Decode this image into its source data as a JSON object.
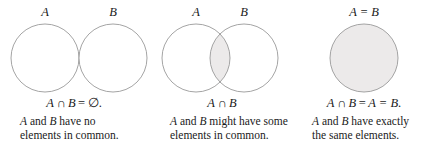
{
  "figure": {
    "colors": {
      "stroke": "#9a9a9a",
      "shade": "#eceaea",
      "text": "#1a1a1a",
      "background": "#ffffff"
    }
  },
  "panels": [
    {
      "id": "disjoint",
      "venn_labels": [
        {
          "text": "A",
          "x": 45
        },
        {
          "text": "B",
          "x": 113
        }
      ],
      "formula": {
        "set_a": "A",
        "intersect": "∩",
        "set_b": "B",
        "equals": "=",
        "result": "∅",
        "period": "."
      },
      "caption": {
        "line1_pre": "A",
        "line1_mid": " and ",
        "line1_var2": "B",
        "line1_post": " have no",
        "line2": "elements in common."
      },
      "shading": "none"
    },
    {
      "id": "overlap",
      "venn_labels": [
        {
          "text": "A",
          "x": 48
        },
        {
          "text": "B",
          "x": 96
        }
      ],
      "formula": {
        "set_a": "A",
        "intersect": "∩",
        "set_b": "B",
        "equals": "",
        "result": "",
        "period": ""
      },
      "caption": {
        "line1_pre": "A",
        "line1_mid": " and ",
        "line1_var2": "B",
        "line1_post": " might have some",
        "line2": "elements in common."
      },
      "shading": "lens"
    },
    {
      "id": "equal",
      "venn_labels": [
        {
          "text": "A = B",
          "x": 68
        }
      ],
      "formula": {
        "set_a": "A",
        "intersect": "∩",
        "set_b": "B",
        "equals": "=",
        "result": "A = B",
        "period": "."
      },
      "caption": {
        "line1_pre": "A",
        "line1_mid": " and ",
        "line1_var2": "B",
        "line1_post": " have exactly",
        "line2": "the same elements."
      },
      "shading": "full"
    }
  ]
}
